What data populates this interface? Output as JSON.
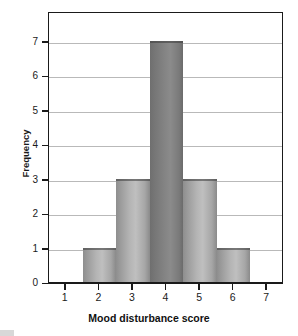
{
  "chart_data": {
    "type": "bar",
    "title": "",
    "subtitle": "",
    "xlabel": "Mood disturbance score",
    "ylabel": "Frequency",
    "categories": [
      "2",
      "3",
      "4",
      "5",
      "6"
    ],
    "values": [
      1,
      3,
      7,
      3,
      1
    ],
    "bins": [
      {
        "label": "1.5-2.5",
        "center": 2,
        "value": 1
      },
      {
        "label": "2.5-3.5",
        "center": 3,
        "value": 3
      },
      {
        "label": "3.5-4.5",
        "center": 4,
        "value": 7
      },
      {
        "label": "4.5-5.5",
        "center": 5,
        "value": 3
      },
      {
        "label": "5.5-6.5",
        "center": 6,
        "value": 1
      }
    ],
    "x_ticks": [
      "1",
      "2",
      "3",
      "4",
      "5",
      "6",
      "7"
    ],
    "y_ticks": [
      "0",
      "1",
      "2",
      "3",
      "4",
      "5",
      "6",
      "7"
    ],
    "xlim": [
      0.5,
      7.5
    ],
    "ylim": [
      0,
      7.8
    ],
    "grid": true,
    "grid_axis": "y",
    "legend": null,
    "legend_position": "none",
    "bar_color": "#b0b0b0",
    "bar_color_peak": "#7e7e7e",
    "grid_color": "#b9b9b9",
    "axis_color": "#1a1a1a",
    "background": "#ffffff"
  },
  "axes": {
    "y_title": "Frequency",
    "x_title": "Mood disturbance score",
    "y_tick_labels": [
      "0",
      "1",
      "2",
      "3",
      "4",
      "5",
      "6",
      "7"
    ],
    "x_tick_labels": [
      "1",
      "2",
      "3",
      "4",
      "5",
      "6",
      "7"
    ]
  }
}
